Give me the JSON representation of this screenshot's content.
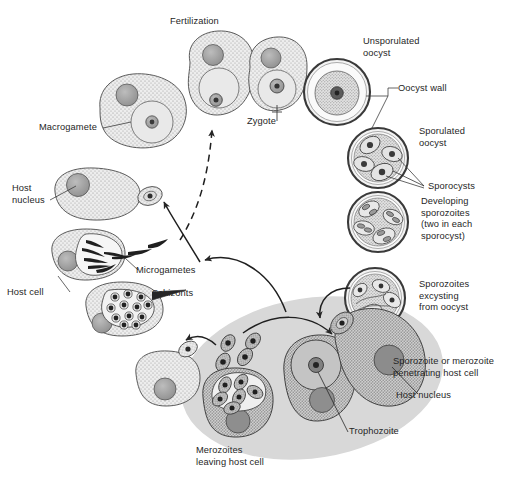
{
  "figure": {
    "background_color": "#ffffff",
    "ink_color": "#262626",
    "host_cell_fill": "#ebebeb",
    "parasite_fill": "#d8d8d8",
    "nucleus_fill": "#a8a8a8",
    "shaded_zone_color": "#d7d7d7",
    "width": 527,
    "height": 483
  },
  "labels": {
    "fertilization": "Fertilization",
    "macrogamete": "Macrogamete",
    "zygote": "Zygote",
    "unsporulated_oocyst": "Unsporulated\noocyst",
    "oocyst_wall": "Oocyst wall",
    "sporulated_oocyst": "Sporulated\noocyst",
    "sporocysts": "Sporocysts",
    "developing_sporozoites": "Developing\nsporozoites\n(two in each\nsporocyst)",
    "sporozoites_excysting": "Sporozoites\nexcysting\nfrom oocyst",
    "host_nucleus_left": "Host\nnucleus",
    "microgametes": "Microgametes",
    "host_cell": "Host cell",
    "schizonts": "Schizonts",
    "merozoites_leaving": "Merozoites\nleaving host cell",
    "trophozoite": "Trophozoite",
    "host_nucleus_right": "Host nucleus",
    "sporozoite_penetrating": "Sporozoite or merozoite\npenetrating host cell"
  },
  "stages": [
    {
      "id": "macrogamete",
      "name": "Macrogamete",
      "phase": "gamogony"
    },
    {
      "id": "fertilization",
      "name": "Fertilization",
      "phase": "gamogony"
    },
    {
      "id": "zygote",
      "name": "Zygote",
      "phase": "gamogony"
    },
    {
      "id": "unsporulated-oocyst",
      "name": "Unsporulated oocyst",
      "phase": "sporogony"
    },
    {
      "id": "sporulated-oocyst",
      "name": "Sporulated oocyst",
      "phase": "sporogony"
    },
    {
      "id": "developing-sporozoites",
      "name": "Developing sporozoites",
      "phase": "sporogony"
    },
    {
      "id": "sporozoites-excysting",
      "name": "Sporozoites excysting from oocyst",
      "phase": "sporogony"
    },
    {
      "id": "trophozoite",
      "name": "Trophozoite",
      "phase": "merogony"
    },
    {
      "id": "schizont",
      "name": "Schizonts",
      "phase": "merogony"
    },
    {
      "id": "merozoites",
      "name": "Merozoites leaving host cell",
      "phase": "merogony"
    },
    {
      "id": "microgametes",
      "name": "Microgametes",
      "phase": "gamogony"
    }
  ]
}
